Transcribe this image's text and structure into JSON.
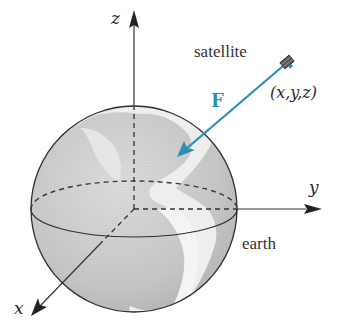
{
  "diagram": {
    "type": "physics-figure",
    "labels": {
      "z_axis": "z",
      "y_axis": "y",
      "x_axis": "x",
      "satellite": "satellite",
      "position": "(x,y,z)",
      "force": "F",
      "earth": "earth"
    },
    "colors": {
      "force_vector": "#2a8fb5",
      "axes": "#333333",
      "globe_fill": "#c9c9c9",
      "land": "#ececec",
      "outline": "#2f2f2f"
    },
    "geometry": {
      "origin": [
        134,
        209
      ],
      "earth_radius": 103,
      "satellite_position": [
        287,
        62
      ],
      "force_tip": [
        177,
        157
      ]
    }
  }
}
